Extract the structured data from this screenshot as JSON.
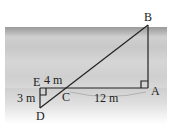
{
  "figure": {
    "points": {
      "A": "A",
      "B": "B",
      "C": "C",
      "D": "D",
      "E": "E"
    },
    "measurements": {
      "EC": "4 m",
      "ED": "3 m",
      "CA": "12 m"
    },
    "colors": {
      "line": "#222222",
      "river": "#cfcfcf",
      "bank": "#dedede"
    }
  }
}
